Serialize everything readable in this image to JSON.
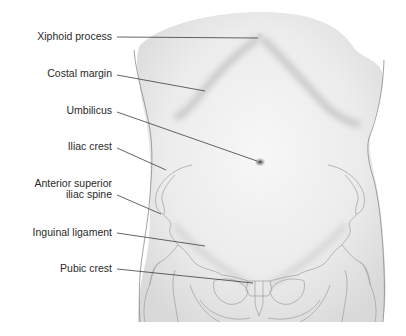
{
  "figure": {
    "colors": {
      "background": "#ffffff",
      "skin": "#eeeeee",
      "skin_shadow": "#d4d4d4",
      "outline": "#8a8a8a",
      "bone_outline": "#a0a0a0",
      "leader_line": "#333333",
      "label_text": "#2a2a2a"
    }
  },
  "labels": [
    {
      "id": "xiphoid-process",
      "text": "Xiphoid process"
    },
    {
      "id": "costal-margin",
      "text": "Costal margin"
    },
    {
      "id": "umbilicus",
      "text": "Umbilicus"
    },
    {
      "id": "iliac-crest",
      "text": "Iliac crest"
    },
    {
      "id": "anterior-superior-iliac-spine",
      "lines": [
        "Anterior superior",
        "iliac spine"
      ]
    },
    {
      "id": "inguinal-ligament",
      "text": "Inguinal ligament"
    },
    {
      "id": "pubic-crest",
      "text": "Pubic crest"
    }
  ]
}
